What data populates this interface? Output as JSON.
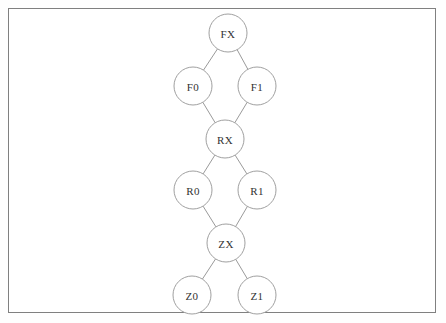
{
  "canvas": {
    "width": 446,
    "height": 323,
    "background_color": "#ffffff"
  },
  "frame": {
    "x": 8,
    "y": 8,
    "width": 428,
    "height": 305,
    "border_color": "#808080"
  },
  "diagram": {
    "type": "graph",
    "node_radius": 19,
    "node_fill": "#ffffff",
    "node_stroke": "#a0a0a0",
    "edge_stroke": "#9a9a9a",
    "label_color": "#333333",
    "nodes": [
      {
        "id": "FX",
        "label": "FX",
        "cx": 228,
        "cy": 33
      },
      {
        "id": "F0",
        "label": "F0",
        "cx": 193,
        "cy": 86
      },
      {
        "id": "F1",
        "label": "F1",
        "cx": 257,
        "cy": 86
      },
      {
        "id": "RX",
        "label": "RX",
        "cx": 225,
        "cy": 139
      },
      {
        "id": "R0",
        "label": "R0",
        "cx": 193,
        "cy": 190
      },
      {
        "id": "R1",
        "label": "R1",
        "cx": 257,
        "cy": 190
      },
      {
        "id": "ZX",
        "label": "ZX",
        "cx": 226,
        "cy": 243
      },
      {
        "id": "Z0",
        "label": "Z0",
        "cx": 192,
        "cy": 295
      },
      {
        "id": "Z1",
        "label": "Z1",
        "cx": 257,
        "cy": 295
      }
    ],
    "edges": [
      {
        "from": "FX",
        "to": "F0"
      },
      {
        "from": "FX",
        "to": "F1"
      },
      {
        "from": "F0",
        "to": "RX"
      },
      {
        "from": "F1",
        "to": "RX"
      },
      {
        "from": "RX",
        "to": "R0"
      },
      {
        "from": "RX",
        "to": "R1"
      },
      {
        "from": "R0",
        "to": "ZX"
      },
      {
        "from": "R1",
        "to": "ZX"
      },
      {
        "from": "ZX",
        "to": "Z0"
      },
      {
        "from": "ZX",
        "to": "Z1"
      }
    ]
  }
}
